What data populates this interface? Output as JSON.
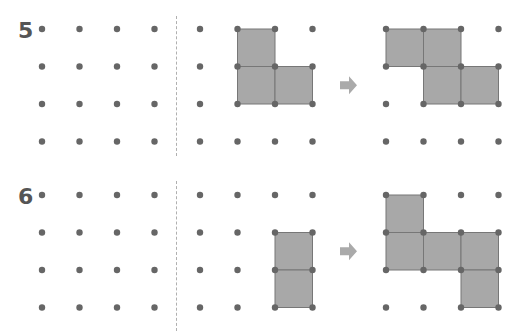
{
  "colors": {
    "dot": "#666666",
    "square_fill": "#a8a8a8",
    "square_stroke": "#777777",
    "arrow": "#aaaaaa",
    "number": "#555555",
    "divider": "#b0b0b0"
  },
  "grid": {
    "rows": 4,
    "cols": 4,
    "spacing": 37.5,
    "left_grid_x": 42,
    "middle_grid_x": 200,
    "right_grid_x": 386
  },
  "problems": [
    {
      "number": "5",
      "top": 29,
      "given_shape_cells": [
        [
          1,
          0
        ],
        [
          1,
          1
        ],
        [
          2,
          1
        ]
      ],
      "answer_shape_cells": [
        [
          0,
          0
        ],
        [
          1,
          0
        ],
        [
          1,
          1
        ],
        [
          2,
          1
        ]
      ],
      "arrow": "right-arrow"
    },
    {
      "number": "6",
      "top": 195,
      "given_shape_cells": [
        [
          2,
          1
        ],
        [
          2,
          2
        ]
      ],
      "answer_shape_cells": [
        [
          0,
          0
        ],
        [
          0,
          1
        ],
        [
          1,
          1
        ],
        [
          2,
          1
        ],
        [
          2,
          2
        ]
      ],
      "arrow": "right-arrow"
    }
  ]
}
